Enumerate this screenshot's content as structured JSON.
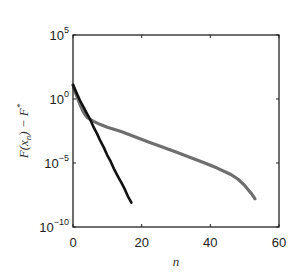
{
  "chart_data": {
    "type": "line",
    "title": "",
    "xlabel": "n",
    "ylabel": "F(x_n) − F*",
    "ylabel_parts": {
      "main": "F(x",
      "sub": "n",
      "close": ") − F",
      "sup": "*"
    },
    "xlim": [
      0,
      60
    ],
    "ylim_log10": [
      -10,
      5
    ],
    "yscale": "log",
    "grid": false,
    "legend": null,
    "x_ticks": [
      0,
      20,
      40,
      60
    ],
    "x_tick_labels": [
      "0",
      "20",
      "40",
      "60"
    ],
    "y_ticks_log10": [
      5,
      0,
      -5,
      -10
    ],
    "y_tick_labels": [
      {
        "base": "10",
        "exp": "5"
      },
      {
        "base": "10",
        "exp": "0"
      },
      {
        "base": "10",
        "exp": "−5"
      },
      {
        "base": "10",
        "exp": "−10"
      }
    ],
    "series": [
      {
        "name": "black",
        "color": "#111111",
        "width": 2.6,
        "x": [
          0,
          1,
          2,
          3,
          4,
          5,
          6,
          7,
          8,
          9,
          10,
          11,
          12,
          13,
          14,
          15,
          16,
          17
        ],
        "log10_y": [
          1.1,
          0.5,
          -0.1,
          -0.6,
          -1.1,
          -1.6,
          -2.2,
          -2.7,
          -3.3,
          -3.8,
          -4.4,
          -4.9,
          -5.5,
          -6.0,
          -6.5,
          -7.0,
          -7.6,
          -8.1
        ]
      },
      {
        "name": "gray",
        "color": "#6e6e6e",
        "width": 3.2,
        "x": [
          0,
          1,
          2,
          3,
          4,
          5,
          6,
          8,
          10,
          14,
          18,
          22,
          26,
          30,
          34,
          38,
          42,
          46,
          48,
          50,
          52,
          53
        ],
        "log10_y": [
          1.1,
          0.3,
          -0.4,
          -1.0,
          -1.4,
          -1.6,
          -1.75,
          -2.0,
          -2.2,
          -2.55,
          -2.95,
          -3.35,
          -3.75,
          -4.15,
          -4.55,
          -4.95,
          -5.4,
          -5.9,
          -6.25,
          -6.75,
          -7.4,
          -7.8
        ]
      }
    ]
  },
  "colors": {
    "axis": "#222222",
    "background": "#ffffff"
  }
}
